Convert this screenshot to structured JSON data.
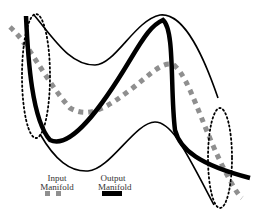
{
  "diagram": {
    "colors": {
      "input_manifold": "#8f8f8f",
      "output_manifold": "#000000",
      "boundary": "#000000",
      "background": "#ffffff"
    },
    "curves": [
      {
        "name": "input-manifold",
        "style": "thick gray dashed (square dots)"
      },
      {
        "name": "output-manifold",
        "style": "thick solid black"
      },
      {
        "name": "upper-envelope",
        "style": "thin solid black"
      },
      {
        "name": "lower-envelope",
        "style": "thin solid black"
      },
      {
        "name": "left-ellipse",
        "style": "dotted black"
      },
      {
        "name": "right-ellipse",
        "style": "dotted black"
      }
    ],
    "legend": {
      "input_label_line1": "Input",
      "input_label_line2": "Manifold",
      "output_label_line1": "Output",
      "output_label_line2": "Manifold"
    }
  }
}
